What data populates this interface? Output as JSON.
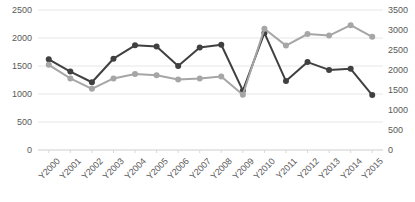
{
  "chart_data": {
    "type": "line",
    "title": "",
    "xlabel": "",
    "ylabel": "",
    "grid": true,
    "legend_position": "none",
    "categories": [
      "Y2000",
      "Y2001",
      "Y2002",
      "Y2003",
      "Y2004",
      "Y2005",
      "Y2006",
      "Y2007",
      "Y2008",
      "Y2009",
      "Y2010",
      "Y2011",
      "Y2012",
      "Y2013",
      "Y2014",
      "Y2015"
    ],
    "left_axis": {
      "ticks": [
        0,
        500,
        1000,
        1500,
        2000,
        2500
      ],
      "ylim": [
        0,
        2500
      ]
    },
    "right_axis": {
      "ticks": [
        0,
        500,
        1000,
        1500,
        2000,
        2500,
        3000,
        3500
      ],
      "ylim": [
        0,
        3500
      ]
    },
    "series": [
      {
        "name": "dark-series",
        "axis": "left",
        "color": "#404040",
        "marker": "circle",
        "values": [
          1620,
          1400,
          1210,
          1630,
          1870,
          1850,
          1500,
          1830,
          1880,
          1060,
          2090,
          1230,
          1570,
          1430,
          1450,
          980
        ]
      },
      {
        "name": "gray-series",
        "axis": "right",
        "color": "#a6a6a6",
        "marker": "circle",
        "values": [
          2130,
          1790,
          1530,
          1790,
          1900,
          1870,
          1760,
          1790,
          1840,
          1380,
          3030,
          2610,
          2900,
          2860,
          3120,
          2830
        ]
      }
    ]
  }
}
